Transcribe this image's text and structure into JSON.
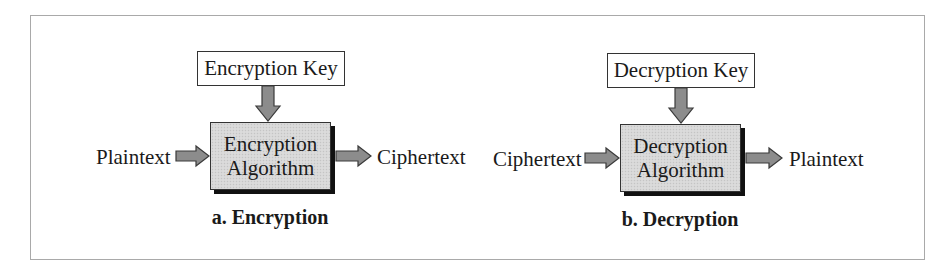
{
  "diagram": {
    "colors": {
      "frame_border": "#a9a9a9",
      "box_border": "#333333",
      "algorithm_fill": "#d7d7d7",
      "arrow_fill": "#8c8c8c",
      "shadow": "#111111"
    },
    "panels": [
      {
        "id": "encryption",
        "key_label": "Encryption Key",
        "algorithm_line1": "Encryption",
        "algorithm_line2": "Algorithm",
        "input_label": "Plaintext",
        "output_label": "Ciphertext",
        "caption": "a. Encryption"
      },
      {
        "id": "decryption",
        "key_label": "Decryption Key",
        "algorithm_line1": "Decryption",
        "algorithm_line2": "Algorithm",
        "input_label": "Ciphertext",
        "output_label": "Plaintext",
        "caption": "b. Decryption"
      }
    ]
  }
}
